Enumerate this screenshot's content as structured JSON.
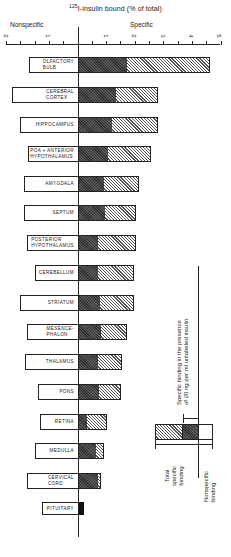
{
  "chart_data": {
    "type": "bar",
    "orientation": "horizontal",
    "title": "125I-insulin bound (% of total)",
    "title_superscript": "125",
    "title_rest": "I-insulin bound (% of total)",
    "left_axis_label": "Nonspecific",
    "right_axis_label": "Specific",
    "axis": {
      "zero_x_px": 78,
      "px_per_unit": 28.5,
      "nonspecific_ticks": [
        "2",
        "1"
      ],
      "specific_ticks": [
        "1",
        "2",
        "3",
        "4",
        "5"
      ],
      "xlim_nonspecific": [
        0,
        2
      ],
      "xlim_specific": [
        0,
        5
      ]
    },
    "categories": [
      "OLFACTORY BULB",
      "CEREBRAL CORTEX",
      "HIPPOCAMPUS",
      "POA + ANTERIOR HYPOTHALAMUS",
      "AMYGDALA",
      "SEPTUM",
      "POSTERIOR HYPOTHALAMUS",
      "CEREBELLUM",
      "STRIATUM",
      "MESENCEPHALON",
      "THALAMUS",
      "PONS",
      "RETINA",
      "MEDULLA",
      "CERVICAL CORD",
      "PITUITARY"
    ],
    "series": [
      {
        "name": "Nonspecific binding",
        "values": [
          1.7,
          2.3,
          2.0,
          1.75,
          1.9,
          1.9,
          1.8,
          1.5,
          2.0,
          1.8,
          1.85,
          1.4,
          1.35,
          1.5,
          1.8,
          1.3
        ]
      },
      {
        "name": "Specific binding in the presence of 20 ng per ml unlabeled insulin",
        "values": [
          1.7,
          1.3,
          1.2,
          1.05,
          0.9,
          0.95,
          0.7,
          0.7,
          0.8,
          0.8,
          0.7,
          0.75,
          0.3,
          0.65,
          0.7,
          0.2
        ]
      },
      {
        "name": "Total specific binding",
        "values": [
          4.6,
          2.8,
          2.8,
          2.55,
          2.15,
          2.05,
          2.05,
          2.0,
          2.0,
          1.7,
          1.55,
          1.5,
          1.0,
          0.9,
          0.8,
          0.2
        ]
      }
    ],
    "legend": {
      "position": "right",
      "items": [
        "Total specific binding",
        "Specific binding in the presence of 20 ng per ml unlabeled insulin",
        "Nonspecific binding"
      ]
    },
    "grid": false
  },
  "labels": {
    "title_sup": "125",
    "title_rest": "I-insulin bound (% of total)",
    "nonspecific": "Nonspecific",
    "specific": "Specific",
    "legend_specific_unlabeled_line1": "Specific binding in the presence",
    "legend_specific_unlabeled_line2": "of 20 ng per ml unlabeled insulin",
    "legend_total_line1": "Total",
    "legend_total_line2": "specific",
    "legend_total_line3": "binding",
    "legend_nonspecific_line1": "Nonspecific",
    "legend_nonspecific_line2": "binding"
  },
  "ticks": {
    "left": [
      {
        "label": "2",
        "x": 6
      },
      {
        "label": "1",
        "x": 48
      }
    ],
    "right": [
      {
        "label": "1",
        "x": 106
      },
      {
        "label": "2",
        "x": 134
      },
      {
        "label": "3",
        "x": 163
      },
      {
        "label": "4",
        "x": 191
      },
      {
        "label": "5",
        "x": 219
      }
    ]
  },
  "bars": [
    {
      "label1": "OLFACTORY",
      "label2": "BULB",
      "top": 57,
      "ns_left": 29,
      "dark_right": 127,
      "hatch_right": 210
    },
    {
      "label1": "CEREBRAL",
      "label2": "CORTEX",
      "top": 87,
      "ns_left": 12,
      "dark_right": 116,
      "hatch_right": 158
    },
    {
      "label1": "HIPPOCAMPUS",
      "label2": "",
      "top": 117,
      "ns_left": 20,
      "dark_right": 112,
      "hatch_right": 158
    },
    {
      "label1": "POA + ANTERIOR",
      "label2": "HYPOTHALAMUS",
      "top": 146,
      "ns_left": 28,
      "dark_right": 108,
      "hatch_right": 151
    },
    {
      "label1": "AMYGDALA",
      "label2": "",
      "top": 176,
      "ns_left": 24,
      "dark_right": 104,
      "hatch_right": 139
    },
    {
      "label1": "SEPTUM",
      "label2": "",
      "top": 205,
      "ns_left": 24,
      "dark_right": 105,
      "hatch_right": 136
    },
    {
      "label1": "POSTERIOR",
      "label2": "HYPOTHALAMUS",
      "top": 235,
      "ns_left": 27,
      "dark_right": 98,
      "hatch_right": 136
    },
    {
      "label1": "CEREBELLUM",
      "label2": "",
      "top": 265,
      "ns_left": 35,
      "dark_right": 98,
      "hatch_right": 134
    },
    {
      "label1": "STRIATUM",
      "label2": "",
      "top": 295,
      "ns_left": 20,
      "dark_right": 100,
      "hatch_right": 134
    },
    {
      "label1": "MESENCE-",
      "label2": "PHALON",
      "top": 324,
      "ns_left": 27,
      "dark_right": 101,
      "hatch_right": 127
    },
    {
      "label1": "THALAMUS",
      "label2": "",
      "top": 354,
      "ns_left": 25,
      "dark_right": 98,
      "hatch_right": 122
    },
    {
      "label1": "PONS",
      "label2": "",
      "top": 384,
      "ns_left": 38,
      "dark_right": 99,
      "hatch_right": 121
    },
    {
      "label1": "RETINA",
      "label2": "",
      "top": 414,
      "ns_left": 40,
      "dark_right": 87,
      "hatch_right": 107
    },
    {
      "label1": "MEDULLA",
      "label2": "",
      "top": 443,
      "ns_left": 35,
      "dark_right": 96,
      "hatch_right": 104
    },
    {
      "label1": "CERVICAL",
      "label2": "CORD",
      "top": 473,
      "ns_left": 27,
      "dark_right": 98,
      "hatch_right": 101
    },
    {
      "label1": "PITUITARY",
      "label2": "",
      "top": 502,
      "ns_left": 42,
      "dark_right": 84,
      "hatch_right": 84,
      "black": true
    }
  ]
}
